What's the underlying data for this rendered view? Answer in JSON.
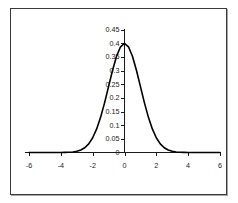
{
  "chart_data": {
    "type": "line",
    "title": "",
    "subtitle": "",
    "xlabel": "",
    "ylabel": "",
    "xlim": [
      -6.5,
      6.5
    ],
    "ylim": [
      0,
      0.45
    ],
    "xticks": [
      -6,
      -4,
      -2,
      0,
      2,
      4,
      6
    ],
    "xtick_labels": [
      "-6",
      "-4",
      "-2",
      "0",
      "2",
      "4",
      "6"
    ],
    "yticks": [
      0,
      0.05,
      0.1,
      0.15,
      0.2,
      0.25,
      0.3,
      0.35,
      0.4,
      0.45
    ],
    "ytick_labels": [
      "0",
      "0.05",
      "0.1",
      "0.15",
      "0.2",
      "0.25",
      "0.3",
      "0.35",
      "0.4",
      "0.45"
    ],
    "grid": false,
    "legend": false,
    "legend_position": "none",
    "annotations": [],
    "axis_position": {
      "x_axis_at_y": 0,
      "y_axis_at_x": 0
    },
    "series": [
      {
        "name": "standard normal pdf",
        "color": "#000000",
        "x": [
          -6,
          -5.75,
          -5.5,
          -5.25,
          -5,
          -4.75,
          -4.5,
          -4.25,
          -4,
          -3.75,
          -3.5,
          -3.25,
          -3,
          -2.75,
          -2.5,
          -2.25,
          -2,
          -1.75,
          -1.5,
          -1.25,
          -1,
          -0.75,
          -0.5,
          -0.25,
          0,
          0.25,
          0.5,
          0.75,
          1,
          1.25,
          1.5,
          1.75,
          2,
          2.25,
          2.5,
          2.75,
          3,
          3.25,
          3.5,
          3.75,
          4,
          4.25,
          4.5,
          4.75,
          5,
          5.25,
          5.5,
          5.75,
          6
        ],
        "y": [
          0.0,
          0.0,
          0.0,
          0.0,
          0.0,
          0.0,
          0.0,
          0.0,
          0.0001,
          0.0004,
          0.0009,
          0.002,
          0.0044,
          0.0091,
          0.0175,
          0.0317,
          0.054,
          0.0863,
          0.1295,
          0.1826,
          0.242,
          0.3011,
          0.3521,
          0.3867,
          0.3989,
          0.3867,
          0.3521,
          0.3011,
          0.242,
          0.1826,
          0.1295,
          0.0863,
          0.054,
          0.0317,
          0.0175,
          0.0091,
          0.0044,
          0.002,
          0.0009,
          0.0004,
          0.0001,
          0.0,
          0.0,
          0.0,
          0.0,
          0.0,
          0.0,
          0.0,
          0.0
        ]
      }
    ]
  },
  "figure": {
    "border_color": "#3a3a3a",
    "background_color": "#ffffff",
    "curve_color": "#000000",
    "axis_color": "#1a1a1a"
  }
}
